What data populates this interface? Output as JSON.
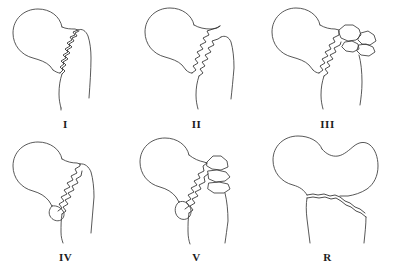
{
  "figure": {
    "background_color": "#ffffff",
    "stroke_color": "#3a3a3a",
    "rows": 2,
    "columns": 3,
    "style": "hand-drawn line art, black outline on white"
  },
  "panels": [
    {
      "id": "panel-1",
      "label": "I",
      "row": 0,
      "column": 0,
      "description": "Undisplaced two-part intertrochanteric fracture; single jagged fracture line from greater trochanter down across the neck base",
      "fragment_count": 2,
      "has_detached_lesser_trochanter": false
    },
    {
      "id": "panel-2",
      "label": "II",
      "row": 0,
      "column": 1,
      "description": "Displaced two-part intertrochanteric fracture with separation along the jagged fracture line",
      "fragment_count": 2,
      "has_detached_lesser_trochanter": false
    },
    {
      "id": "panel-3",
      "label": "III",
      "row": 0,
      "column": 2,
      "description": "Comminuted fracture with greater trochanteric fragmentation; multiple wedge fragments at the trochanteric region",
      "fragment_count": 4,
      "has_detached_lesser_trochanter": false
    },
    {
      "id": "panel-4",
      "label": "IV",
      "row": 1,
      "column": 0,
      "description": "Intertrochanteric fracture with detached lesser trochanter fragment",
      "fragment_count": 3,
      "has_detached_lesser_trochanter": true
    },
    {
      "id": "panel-5",
      "label": "V",
      "row": 1,
      "column": 1,
      "description": "Comminuted four-part fracture with both greater trochanteric fragments and detached lesser trochanter",
      "fragment_count": 5,
      "has_detached_lesser_trochanter": true
    },
    {
      "id": "panel-6",
      "label": "R",
      "row": 1,
      "column": 2,
      "description": "Reverse obliquity fracture; fracture line runs from medial proximal to lateral distal across the subtrochanteric region",
      "fragment_count": 2,
      "has_detached_lesser_trochanter": false
    }
  ]
}
